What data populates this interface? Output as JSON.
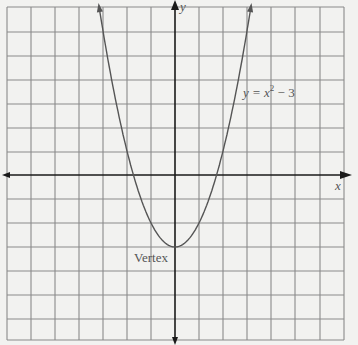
{
  "chart_data": {
    "type": "line",
    "title": "",
    "xlabel": "x",
    "ylabel": "y",
    "equation_label": "y = x² − 3",
    "equation_parts": {
      "lhs": "y = x",
      "exp": "2",
      "rhs": " − 3"
    },
    "annotations": [
      {
        "text": "Vertex",
        "x": 0,
        "y": -3
      }
    ],
    "series": [
      {
        "name": "y = x^2 - 3",
        "function": "x^2 - 3",
        "x": [
          -3.2,
          -3,
          -2.5,
          -2,
          -1.73,
          -1.5,
          -1,
          -0.5,
          0,
          0.5,
          1,
          1.5,
          1.73,
          2,
          2.5,
          3,
          3.2
        ],
        "values": [
          7.24,
          6,
          3.25,
          1,
          0,
          -0.75,
          -2,
          -2.75,
          -3,
          -2.75,
          -2,
          -0.75,
          0,
          1,
          3.25,
          6,
          7.24
        ]
      }
    ],
    "xlim": [
      -7,
      7
    ],
    "ylim": [
      -7,
      7
    ],
    "grid": true,
    "grid_spacing": 1,
    "vertex": [
      0,
      -3
    ],
    "x_intercepts": [
      -1.73,
      1.73
    ],
    "legend": "none"
  },
  "colors": {
    "background": "#f2f2f0",
    "grid": "#8a8a8a",
    "axis": "#1a1a1a",
    "curve": "#555555",
    "text": "#555555"
  }
}
